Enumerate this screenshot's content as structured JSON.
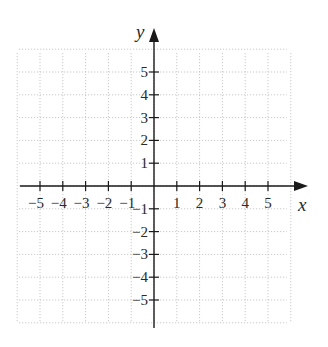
{
  "chart_data": {
    "type": "coordinate-plane",
    "title": "",
    "xlabel": "x",
    "ylabel": "y",
    "xlim": [
      -6,
      6
    ],
    "ylim": [
      -6,
      6
    ],
    "grid": true,
    "grid_style": "dotted",
    "x_ticks": [
      -5,
      -4,
      -3,
      -2,
      -1,
      1,
      2,
      3,
      4,
      5
    ],
    "y_ticks": [
      5,
      4,
      3,
      2,
      1,
      -1,
      -2,
      -3,
      -4,
      -5
    ],
    "x_tick_labels": [
      "−5",
      "−4",
      "−3",
      "−2",
      "−1",
      "1",
      "2",
      "3",
      "4",
      "5"
    ],
    "y_tick_labels": [
      "5",
      "4",
      "3",
      "2",
      "1",
      "−1",
      "−2",
      "−3",
      "−4",
      "−5"
    ],
    "data": []
  },
  "colors": {
    "axis": "#1a1a1a",
    "grid": "#bdbdbd",
    "text": "#2a2a2a",
    "background": "#ffffff"
  }
}
